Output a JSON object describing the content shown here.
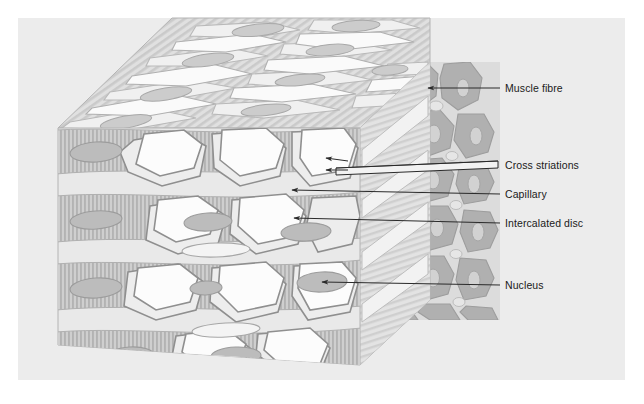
{
  "figure": {
    "panel": {
      "background": "#ececec",
      "page_background": "#ffffff"
    },
    "colors": {
      "page_background": "#ffffff",
      "panel_background": "#ececec",
      "top_face": "#e8e8e8",
      "front_face": "#e4e4e4",
      "side_face_background": "#dcdcdc",
      "striation_stroke": "#c2c2c2",
      "fibre_band": "#c9c9c9",
      "cell_outline": "#9a9a9a",
      "cell_pale": "#e9e9e9",
      "cell_white": "#fbfbfb",
      "nucleus_fill": "#b9b9b9",
      "cross_section_dark": "#b0b0b0",
      "cross_section_light": "#dadada",
      "leader_line": "#2a2a2a",
      "label_text": "#1a1a1a"
    }
  },
  "labels": [
    {
      "id": "muscle-fibre",
      "text": "Muscle fibre",
      "x": 505,
      "y": 83,
      "leader": {
        "x1": 500,
        "y1": 88,
        "x2": 428,
        "y2": 88,
        "arrow": true
      }
    },
    {
      "id": "cross-striations",
      "text": "Cross striations",
      "x": 505,
      "y": 160,
      "leader": {
        "x1": 500,
        "y1": 165,
        "x2": 336,
        "y2": 165,
        "arrow": true
      }
    },
    {
      "id": "capillary",
      "text": "Capillary",
      "x": 505,
      "y": 189,
      "leader": {
        "x1": 500,
        "y1": 194,
        "x2": 292,
        "y2": 190,
        "arrow": true
      }
    },
    {
      "id": "intercalated-disc",
      "text": "Intercalated disc",
      "x": 505,
      "y": 218,
      "leader": {
        "x1": 500,
        "y1": 223,
        "x2": 294,
        "y2": 218,
        "arrow": true
      }
    },
    {
      "id": "nucleus",
      "text": "Nucleus",
      "x": 505,
      "y": 280,
      "leader": {
        "x1": 500,
        "y1": 285,
        "x2": 322,
        "y2": 282,
        "arrow": true
      }
    }
  ]
}
